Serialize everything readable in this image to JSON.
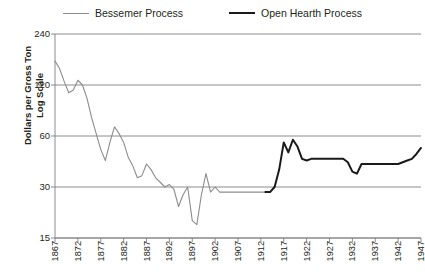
{
  "legend": {
    "items": [
      {
        "label": "Bessemer Process",
        "color": "#8c8c8c",
        "swatch": "bessemer-line-swatch"
      },
      {
        "label": "Open Hearth Process",
        "color": "#1a1a1a",
        "swatch": "open-hearth-line-swatch"
      }
    ]
  },
  "axis": {
    "y_title_line1": "Dollars per Gross Ton",
    "y_title_line2": "Log Scale"
  },
  "chart_data": {
    "type": "line",
    "title": "",
    "subtitle": "",
    "xlabel": "",
    "ylabel": "Dollars per Gross Ton Log Scale",
    "yscale": "log",
    "ylim": [
      15,
      240
    ],
    "yticks": [
      15,
      30,
      60,
      120,
      240
    ],
    "ytick_labels": [
      "15",
      "30",
      "60",
      "120",
      "240"
    ],
    "xlim": [
      1867,
      1947
    ],
    "xticks": [
      1867,
      1872,
      1877,
      1882,
      1887,
      1892,
      1897,
      1902,
      1907,
      1912,
      1917,
      1922,
      1927,
      1932,
      1937,
      1942,
      1947
    ],
    "xtick_labels": [
      "1867",
      "1872",
      "1877",
      "1882",
      "1887",
      "1892",
      "1897",
      "1902",
      "1907",
      "1912",
      "1917",
      "1922",
      "1927",
      "1932",
      "1937",
      "1942",
      "1947"
    ],
    "grid": "horizontal",
    "legend_position": "top-center",
    "series": [
      {
        "name": "Bessemer Process",
        "color": "#8c8c8c",
        "x": [
          1867,
          1868,
          1869,
          1870,
          1871,
          1872,
          1873,
          1874,
          1875,
          1876,
          1877,
          1878,
          1879,
          1880,
          1881,
          1882,
          1883,
          1884,
          1885,
          1886,
          1887,
          1888,
          1889,
          1890,
          1891,
          1892,
          1893,
          1894,
          1895,
          1896,
          1897,
          1898,
          1899,
          1900,
          1901,
          1902,
          1903,
          1904,
          1905,
          1906,
          1907,
          1908,
          1909,
          1910,
          1911,
          1912,
          1913
        ],
        "y": [
          166,
          150,
          126,
          108,
          112,
          128,
          120,
          100,
          77,
          62,
          50,
          43,
          55,
          68,
          62,
          55,
          45,
          40,
          34,
          35,
          41,
          38,
          34,
          32,
          30,
          31,
          29,
          23,
          27,
          30,
          19,
          18,
          27,
          36,
          28,
          30,
          28,
          28,
          28,
          28,
          28,
          28,
          28,
          28,
          28,
          28,
          28
        ]
      },
      {
        "name": "Open Hearth Process",
        "color": "#1a1a1a",
        "x": [
          1913,
          1914,
          1915,
          1916,
          1917,
          1918,
          1919,
          1920,
          1921,
          1922,
          1923,
          1924,
          1925,
          1926,
          1927,
          1928,
          1929,
          1930,
          1931,
          1932,
          1933,
          1934,
          1935,
          1936,
          1937,
          1938,
          1939,
          1940,
          1941,
          1942,
          1943,
          1944,
          1945,
          1946,
          1947
        ],
        "y": [
          28,
          28,
          30,
          38,
          55,
          48,
          57,
          52,
          44,
          43,
          44,
          44,
          44,
          44,
          44,
          44,
          44,
          44,
          42,
          37,
          36,
          41,
          41,
          41,
          41,
          41,
          41,
          41,
          41,
          41,
          42,
          43,
          44,
          47,
          51
        ]
      }
    ]
  }
}
